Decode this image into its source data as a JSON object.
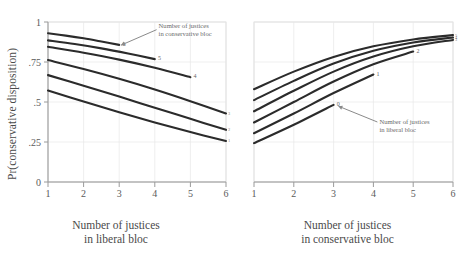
{
  "figure": {
    "ylabel": "Pr(conservative disposition)",
    "background": "#ffffff",
    "line_color": "#2b2b2b",
    "axis_color": "#9a9a9a",
    "grid_color": "#e8e8e8",
    "text_color": "#5a5a5a"
  },
  "panels": {
    "left": {
      "xlabel_line1": "Number of justices",
      "xlabel_line2": "in liberal bloc",
      "annotation_line1": "Number of justices",
      "annotation_line2": "in conservative bloc"
    },
    "right": {
      "xlabel_line1": "Number of justices",
      "xlabel_line2": "in conservative bloc",
      "annotation_line1": "Number of justices",
      "annotation_line2": "in liberal bloc"
    }
  },
  "chart_data": [
    {
      "type": "line",
      "panel": "left",
      "title": "",
      "xlabel": "Number of justices in liberal bloc",
      "ylabel": "Pr(conservative disposition)",
      "xlim": [
        1,
        6
      ],
      "ylim": [
        0,
        1
      ],
      "xticks": [
        "1",
        "2",
        "3",
        "4",
        "5",
        "6"
      ],
      "yticks": [
        "0",
        ".25",
        ".5",
        ".75",
        "1"
      ],
      "grid": true,
      "legend": "endpoint-labels",
      "annotation": "Number of justices in conservative bloc",
      "series": [
        {
          "name": "6",
          "label": "6",
          "x": [
            1,
            1.5,
            2,
            2.5,
            3
          ],
          "values": [
            0.93,
            0.915,
            0.898,
            0.878,
            0.857
          ]
        },
        {
          "name": "5",
          "label": "5",
          "x": [
            1,
            1.75,
            2.5,
            3.25,
            4
          ],
          "values": [
            0.885,
            0.862,
            0.835,
            0.803,
            0.768
          ]
        },
        {
          "name": "4",
          "label": "4",
          "x": [
            1,
            2,
            3,
            4,
            5
          ],
          "values": [
            0.845,
            0.808,
            0.765,
            0.714,
            0.655
          ]
        },
        {
          "name": "3",
          "label": "3",
          "x": [
            1,
            2,
            3,
            4,
            5,
            6
          ],
          "values": [
            0.762,
            0.706,
            0.645,
            0.578,
            0.505,
            0.428
          ]
        },
        {
          "name": "2",
          "label": "2",
          "x": [
            1,
            2,
            3,
            4,
            5,
            6
          ],
          "values": [
            0.668,
            0.602,
            0.534,
            0.464,
            0.395,
            0.326
          ]
        },
        {
          "name": "1",
          "label": "1",
          "x": [
            1,
            2,
            3,
            4,
            5,
            6
          ],
          "values": [
            0.572,
            0.503,
            0.436,
            0.372,
            0.312,
            0.256
          ]
        }
      ]
    },
    {
      "type": "line",
      "panel": "right",
      "title": "",
      "xlabel": "Number of justices in conservative bloc",
      "ylabel": "Pr(conservative disposition)",
      "xlim": [
        1,
        6
      ],
      "ylim": [
        0,
        1
      ],
      "xticks": [
        "1",
        "2",
        "3",
        "4",
        "5",
        "6"
      ],
      "yticks": [
        "0",
        ".25",
        ".5",
        ".75",
        "1"
      ],
      "grid": true,
      "legend": "endpoint-labels",
      "annotation": "Number of justices in liberal bloc",
      "series": [
        {
          "name": "5",
          "label": "5",
          "x": [
            1,
            2,
            3,
            4,
            5,
            6
          ],
          "values": [
            0.58,
            0.69,
            0.782,
            0.848,
            0.891,
            0.918
          ]
        },
        {
          "name": "4",
          "label": "4",
          "x": [
            1,
            2,
            3,
            4,
            5,
            6
          ],
          "values": [
            0.512,
            0.632,
            0.74,
            0.82,
            0.872,
            0.903
          ]
        },
        {
          "name": "3",
          "label": "3",
          "x": [
            1,
            2,
            3,
            4,
            5,
            6
          ],
          "values": [
            0.442,
            0.57,
            0.69,
            0.784,
            0.848,
            0.888
          ]
        },
        {
          "name": "2",
          "label": "2",
          "x": [
            1,
            2,
            3,
            4,
            5
          ],
          "values": [
            0.372,
            0.5,
            0.628,
            0.736,
            0.815
          ]
        },
        {
          "name": "1",
          "label": "1",
          "x": [
            1,
            2,
            3,
            4
          ],
          "values": [
            0.305,
            0.428,
            0.556,
            0.672
          ]
        },
        {
          "name": "0",
          "label": "0",
          "x": [
            1,
            2,
            3
          ],
          "values": [
            0.243,
            0.358,
            0.482
          ]
        }
      ]
    }
  ]
}
